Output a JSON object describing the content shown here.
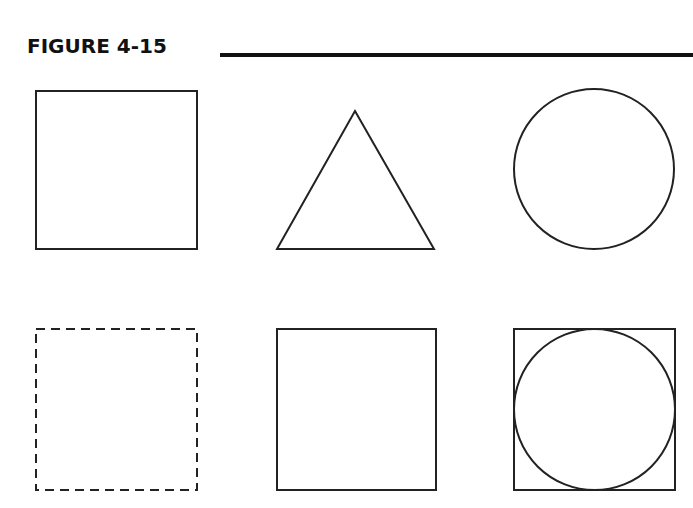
{
  "figure": {
    "title": "FIGURE 4-15",
    "stroke_color": "#222222",
    "background": "#ffffff"
  },
  "shapes": [
    {
      "id": "square-solid",
      "type": "square",
      "style": "solid",
      "row": 1,
      "col": 1
    },
    {
      "id": "triangle",
      "type": "equilateral-triangle",
      "style": "solid",
      "row": 1,
      "col": 2
    },
    {
      "id": "circle",
      "type": "circle",
      "style": "solid",
      "row": 1,
      "col": 3
    },
    {
      "id": "square-dashed",
      "type": "square",
      "style": "dashed",
      "row": 2,
      "col": 1
    },
    {
      "id": "square-solid-2",
      "type": "square",
      "style": "solid",
      "row": 2,
      "col": 2
    },
    {
      "id": "square-with-inscribed-circle",
      "type": "square+circle",
      "style": "solid",
      "row": 2,
      "col": 3
    }
  ]
}
